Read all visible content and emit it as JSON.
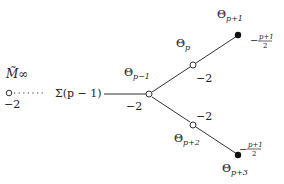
{
  "diagram": {
    "type": "plumbing-graph",
    "left_node": {
      "label": "M̃∞",
      "weight": "−2"
    },
    "chain_label": "Σ(p − 1)",
    "branch_node": {
      "label_base": "Θ",
      "label_sub": "p−1",
      "weight": "−2"
    },
    "upper_node": {
      "label_base": "Θ",
      "label_sub": "p",
      "weight": "−2"
    },
    "upper_end": {
      "label_base": "Θ",
      "label_sub": "p+1",
      "weight_num": "p+1",
      "weight_den": "2",
      "weight_sign": "−"
    },
    "lower_node": {
      "label_base": "Θ",
      "label_sub": "p+2",
      "weight": "−2"
    },
    "lower_end": {
      "label_base": "Θ",
      "label_sub": "p+3",
      "weight_num": "p+1",
      "weight_den": "2",
      "weight_sign": "−"
    }
  }
}
